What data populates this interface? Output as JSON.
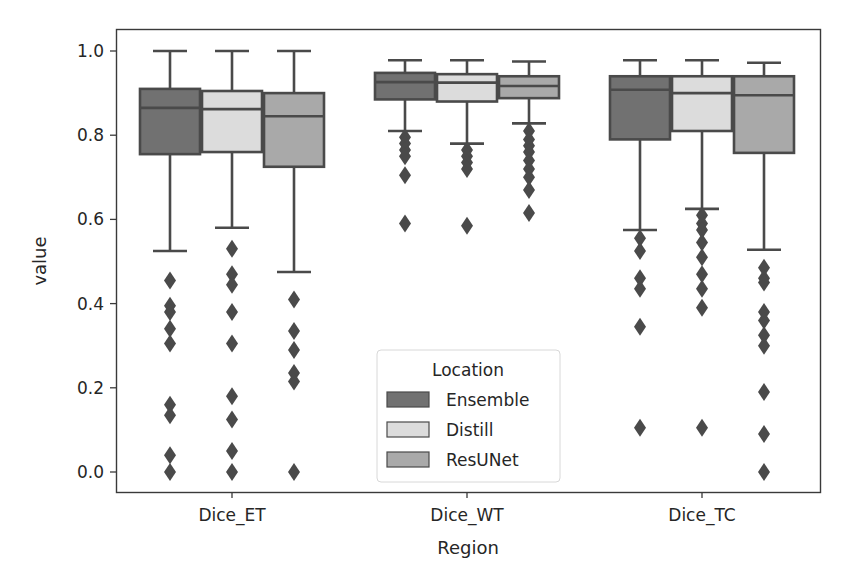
{
  "chart_data": {
    "type": "box",
    "title": "",
    "xlabel": "Region",
    "ylabel": "value",
    "categories": [
      "Dice_ET",
      "Dice_WT",
      "Dice_TC"
    ],
    "yticks": [
      "0.0",
      "0.2",
      "0.4",
      "0.6",
      "0.8",
      "1.0"
    ],
    "ylim": [
      -0.05,
      1.05
    ],
    "grid": false,
    "legend": {
      "title": "Location",
      "position": "lower center",
      "entries": [
        "Ensemble",
        "Distill",
        "ResUNet"
      ]
    },
    "series": [
      {
        "name": "Ensemble",
        "color": "#717171",
        "boxes": [
          {
            "category": "Dice_ET",
            "whisker_low": 0.525,
            "q1": 0.755,
            "median": 0.865,
            "q3": 0.91,
            "whisker_high": 1.0,
            "outliers": [
              0.455,
              0.395,
              0.38,
              0.34,
              0.305,
              0.16,
              0.135,
              0.04,
              0.0
            ]
          },
          {
            "category": "Dice_WT",
            "whisker_low": 0.81,
            "q1": 0.885,
            "median": 0.926,
            "q3": 0.948,
            "whisker_high": 0.978,
            "outliers": [
              0.795,
              0.78,
              0.765,
              0.75,
              0.705,
              0.59
            ]
          },
          {
            "category": "Dice_TC",
            "whisker_low": 0.575,
            "q1": 0.79,
            "median": 0.908,
            "q3": 0.94,
            "whisker_high": 0.978,
            "outliers": [
              0.555,
              0.525,
              0.46,
              0.435,
              0.345,
              0.105
            ]
          }
        ]
      },
      {
        "name": "Distill",
        "color": "#dcdcdc",
        "boxes": [
          {
            "category": "Dice_ET",
            "whisker_low": 0.58,
            "q1": 0.76,
            "median": 0.862,
            "q3": 0.905,
            "whisker_high": 1.0,
            "outliers": [
              0.53,
              0.47,
              0.445,
              0.38,
              0.305,
              0.18,
              0.125,
              0.05,
              0.0
            ]
          },
          {
            "category": "Dice_WT",
            "whisker_low": 0.78,
            "q1": 0.88,
            "median": 0.925,
            "q3": 0.945,
            "whisker_high": 0.978,
            "outliers": [
              0.765,
              0.75,
              0.735,
              0.72,
              0.585
            ]
          },
          {
            "category": "Dice_TC",
            "whisker_low": 0.625,
            "q1": 0.81,
            "median": 0.9,
            "q3": 0.94,
            "whisker_high": 0.978,
            "outliers": [
              0.61,
              0.59,
              0.575,
              0.545,
              0.51,
              0.47,
              0.435,
              0.39,
              0.105
            ]
          }
        ]
      },
      {
        "name": "ResUNet",
        "color": "#a9a9a9",
        "boxes": [
          {
            "category": "Dice_ET",
            "whisker_low": 0.475,
            "q1": 0.725,
            "median": 0.845,
            "q3": 0.9,
            "whisker_high": 1.0,
            "outliers": [
              0.41,
              0.335,
              0.29,
              0.235,
              0.215,
              0.0
            ]
          },
          {
            "category": "Dice_WT",
            "whisker_low": 0.828,
            "q1": 0.888,
            "median": 0.917,
            "q3": 0.94,
            "whisker_high": 0.975,
            "outliers": [
              0.81,
              0.79,
              0.775,
              0.76,
              0.74,
              0.72,
              0.7,
              0.67,
              0.615
            ]
          },
          {
            "category": "Dice_TC",
            "whisker_low": 0.528,
            "q1": 0.758,
            "median": 0.895,
            "q3": 0.94,
            "whisker_high": 0.972,
            "outliers": [
              0.485,
              0.46,
              0.45,
              0.38,
              0.36,
              0.325,
              0.3,
              0.19,
              0.09,
              0.0
            ]
          }
        ]
      }
    ]
  },
  "style": {
    "line_color": "#4a4a4a",
    "frame_color": "#3a3a3a",
    "text_color": "#262626"
  }
}
